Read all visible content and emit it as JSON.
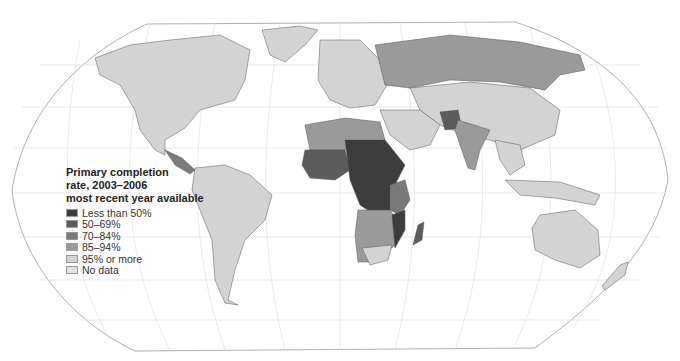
{
  "map": {
    "projection": "Robinson-like world map",
    "colors": {
      "less_than_50": "#3d3d3d",
      "50_69": "#5c5c5c",
      "70_84": "#7a7a7a",
      "85_94": "#9a9a9a",
      "95_or_more": "#d3d3d3",
      "no_data": "#e2e2e2",
      "graticule": "#dcdcdc",
      "border": "#555555",
      "ocean": "#ffffff"
    }
  },
  "legend": {
    "title_line1": "Primary completion",
    "title_line2": "rate, 2003–2006",
    "title_line3": "most recent year available",
    "items": [
      {
        "label": "Less than 50%",
        "color": "#3d3d3d"
      },
      {
        "label": "50–69%",
        "color": "#5c5c5c"
      },
      {
        "label": "70–84%",
        "color": "#7a7a7a"
      },
      {
        "label": "85–94%",
        "color": "#9a9a9a"
      },
      {
        "label": "95% or more",
        "color": "#d3d3d3"
      },
      {
        "label": "No data",
        "color": "#e2e2e2"
      }
    ]
  }
}
